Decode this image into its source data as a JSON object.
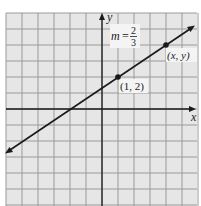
{
  "chart_data": {
    "type": "line",
    "title": "",
    "xlabel": "x",
    "ylabel": "y",
    "xlim": [
      -6,
      6
    ],
    "ylim": [
      -6,
      6
    ],
    "grid": true,
    "grid_step": 1,
    "series": [
      {
        "name": "line",
        "slope": 0.6667,
        "intercept": 1.3333,
        "x": [
          -6,
          5.8
        ],
        "y": [
          -2.67,
          5.2
        ]
      }
    ],
    "points": [
      {
        "x": 1,
        "y": 2,
        "label": "(1, 2)"
      },
      {
        "x": 4,
        "y": 4,
        "label": "(x, y)"
      }
    ],
    "annotations": [
      {
        "text": "m = 2/3",
        "numerator": "2",
        "denominator": "3"
      }
    ]
  },
  "labels": {
    "x_axis": "x",
    "y_axis": "y",
    "slope_m": "m",
    "slope_eq": "=",
    "slope_num": "2",
    "slope_den": "3",
    "point1": "(1, 2)",
    "point2": "(x, y)"
  },
  "colors": {
    "grid_bg": "#e6e6e6",
    "grid_line": "#9a9a9a",
    "axis": "#1a1a1a",
    "line": "#1a1a1a"
  }
}
